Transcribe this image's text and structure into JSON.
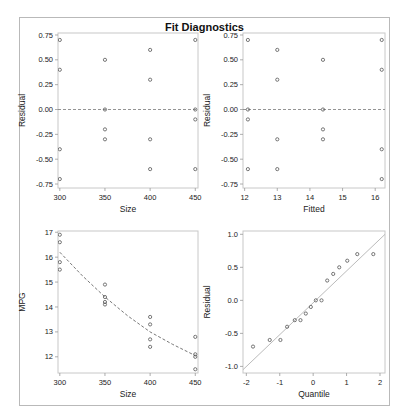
{
  "figure": {
    "title": "Fit Diagnostics",
    "frame_color": "#b9b9b9",
    "marker_color": "#555555",
    "ref_line_color": "#888888",
    "qq_line_color": "#bbbbbb"
  },
  "chart_data": [
    {
      "id": "residual-vs-size",
      "type": "scatter",
      "title": "",
      "xlabel": "Size",
      "ylabel": "Residual",
      "xlim": [
        298,
        453
      ],
      "ylim": [
        -0.79,
        0.77
      ],
      "xticks": [
        300,
        350,
        400,
        450
      ],
      "xtick_labels": [
        "300",
        "350",
        "400",
        "450"
      ],
      "yticks": [
        0.75,
        0.5,
        0.25,
        0.0,
        -0.25,
        -0.5,
        -0.75
      ],
      "ytick_labels": [
        "0.75",
        "0.50",
        "0.25",
        "0.00",
        "-0.25",
        "-0.50",
        "-0.75"
      ],
      "reference_line": {
        "type": "horizontal",
        "y": 0,
        "style": "dashed"
      },
      "points": [
        [
          300,
          0.7
        ],
        [
          300,
          0.4
        ],
        [
          300,
          -0.4
        ],
        [
          300,
          -0.7
        ],
        [
          350,
          0.5
        ],
        [
          350,
          0.0
        ],
        [
          350,
          -0.2
        ],
        [
          350,
          -0.3
        ],
        [
          400,
          0.6
        ],
        [
          400,
          0.3
        ],
        [
          400,
          -0.3
        ],
        [
          400,
          -0.6
        ],
        [
          450,
          0.7
        ],
        [
          450,
          0.0
        ],
        [
          450,
          -0.1
        ],
        [
          450,
          -0.6
        ]
      ]
    },
    {
      "id": "residual-vs-fitted",
      "type": "scatter",
      "title": "",
      "xlabel": "Fitted",
      "ylabel": "Residual",
      "xlim": [
        11.95,
        16.3
      ],
      "ylim": [
        -0.79,
        0.77
      ],
      "xticks": [
        12,
        13,
        14,
        15,
        16
      ],
      "xtick_labels": [
        "12",
        "13",
        "14",
        "15",
        "16"
      ],
      "yticks": [
        0.75,
        0.5,
        0.25,
        0.0,
        -0.25,
        -0.5,
        -0.75
      ],
      "ytick_labels": [
        "0.75",
        "0.50",
        "0.25",
        "0.00",
        "-0.25",
        "-0.50",
        "-0.75"
      ],
      "reference_line": {
        "type": "horizontal",
        "y": 0,
        "style": "dashed"
      },
      "points": [
        [
          12.1,
          0.7
        ],
        [
          12.1,
          0.0
        ],
        [
          12.1,
          -0.1
        ],
        [
          12.1,
          -0.6
        ],
        [
          13.0,
          0.6
        ],
        [
          13.0,
          0.3
        ],
        [
          13.0,
          -0.3
        ],
        [
          13.0,
          -0.6
        ],
        [
          14.4,
          0.5
        ],
        [
          14.4,
          0.0
        ],
        [
          14.4,
          -0.2
        ],
        [
          14.4,
          -0.3
        ],
        [
          16.2,
          0.7
        ],
        [
          16.2,
          0.4
        ],
        [
          16.2,
          -0.4
        ],
        [
          16.2,
          -0.7
        ]
      ]
    },
    {
      "id": "mpg-vs-size",
      "type": "scatter",
      "title": "",
      "xlabel": "Size",
      "ylabel": "MPG",
      "xlim": [
        298,
        453
      ],
      "ylim": [
        11.35,
        17.05
      ],
      "xticks": [
        300,
        350,
        400,
        450
      ],
      "xtick_labels": [
        "300",
        "350",
        "400",
        "450"
      ],
      "yticks": [
        17,
        16,
        15,
        14,
        13,
        12
      ],
      "ytick_labels": [
        "17",
        "16",
        "15",
        "14",
        "13",
        "12"
      ],
      "fit_curve": {
        "style": "dashed",
        "points": [
          [
            300,
            16.2
          ],
          [
            325,
            15.25
          ],
          [
            350,
            14.4
          ],
          [
            375,
            13.65
          ],
          [
            400,
            13.0
          ],
          [
            425,
            12.5
          ],
          [
            450,
            12.05
          ]
        ]
      },
      "points": [
        [
          300,
          16.9
        ],
        [
          300,
          16.6
        ],
        [
          300,
          15.8
        ],
        [
          300,
          15.5
        ],
        [
          350,
          14.9
        ],
        [
          350,
          14.4
        ],
        [
          350,
          14.2
        ],
        [
          350,
          14.1
        ],
        [
          400,
          13.6
        ],
        [
          400,
          13.3
        ],
        [
          400,
          12.7
        ],
        [
          400,
          12.4
        ],
        [
          450,
          12.8
        ],
        [
          450,
          12.1
        ],
        [
          450,
          12.0
        ],
        [
          450,
          11.5
        ]
      ]
    },
    {
      "id": "residual-qq",
      "type": "scatter",
      "title": "",
      "xlabel": "Quantile",
      "ylabel": "Residual",
      "xlim": [
        -2.1,
        2.15
      ],
      "ylim": [
        -1.1,
        1.05
      ],
      "xticks": [
        -2,
        -1,
        0,
        1,
        2
      ],
      "xtick_labels": [
        "-2",
        "-1",
        "0",
        "1",
        "2"
      ],
      "yticks": [
        1.0,
        0.5,
        0.0,
        -0.5,
        -1.0
      ],
      "ytick_labels": [
        "1.0",
        "0.5",
        "0.0",
        "-0.5",
        "-1.0"
      ],
      "reference_line": {
        "type": "diagonal",
        "from": [
          -2.1,
          -1.05
        ],
        "to": [
          2.15,
          1.0
        ],
        "style": "solid"
      },
      "points": [
        [
          -1.8,
          -0.7
        ],
        [
          -1.3,
          -0.6
        ],
        [
          -0.98,
          -0.6
        ],
        [
          -0.78,
          -0.4
        ],
        [
          -0.55,
          -0.3
        ],
        [
          -0.38,
          -0.3
        ],
        [
          -0.22,
          -0.2
        ],
        [
          -0.07,
          -0.1
        ],
        [
          0.08,
          0.0
        ],
        [
          0.25,
          0.0
        ],
        [
          0.42,
          0.3
        ],
        [
          0.6,
          0.4
        ],
        [
          0.78,
          0.5
        ],
        [
          1.02,
          0.6
        ],
        [
          1.32,
          0.7
        ],
        [
          1.8,
          0.7
        ]
      ]
    }
  ]
}
